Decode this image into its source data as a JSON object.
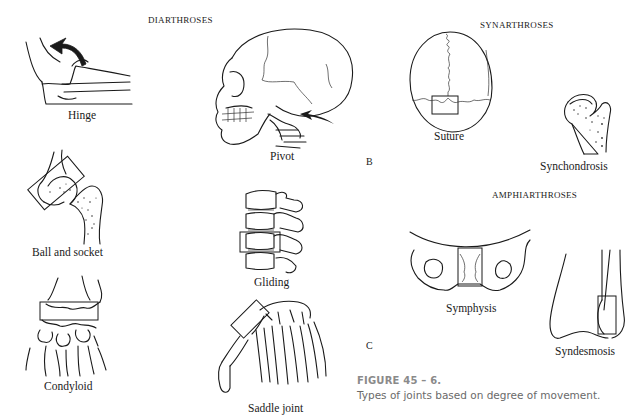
{
  "figure": {
    "sections": {
      "diarthroses": "DIARTHROSES",
      "synarthroses": "SYNARTHROSES",
      "amphiarthroses": "AMPHIARTHROSES"
    },
    "panel_letters": {
      "b": "B",
      "c": "C"
    },
    "joints": {
      "hinge": "Hinge",
      "pivot": "Pivot",
      "ball_and_socket": "Ball and socket",
      "gliding": "Gliding",
      "condyloid": "Condyloid",
      "saddle": "Saddle joint",
      "suture": "Suture",
      "synchondrosis": "Synchondrosis",
      "symphysis": "Symphysis",
      "syndesmosis": "Syndesmosis"
    },
    "caption": {
      "title": "FIGURE 45 – 6.",
      "text": "Types of joints based on degree of movement."
    }
  }
}
